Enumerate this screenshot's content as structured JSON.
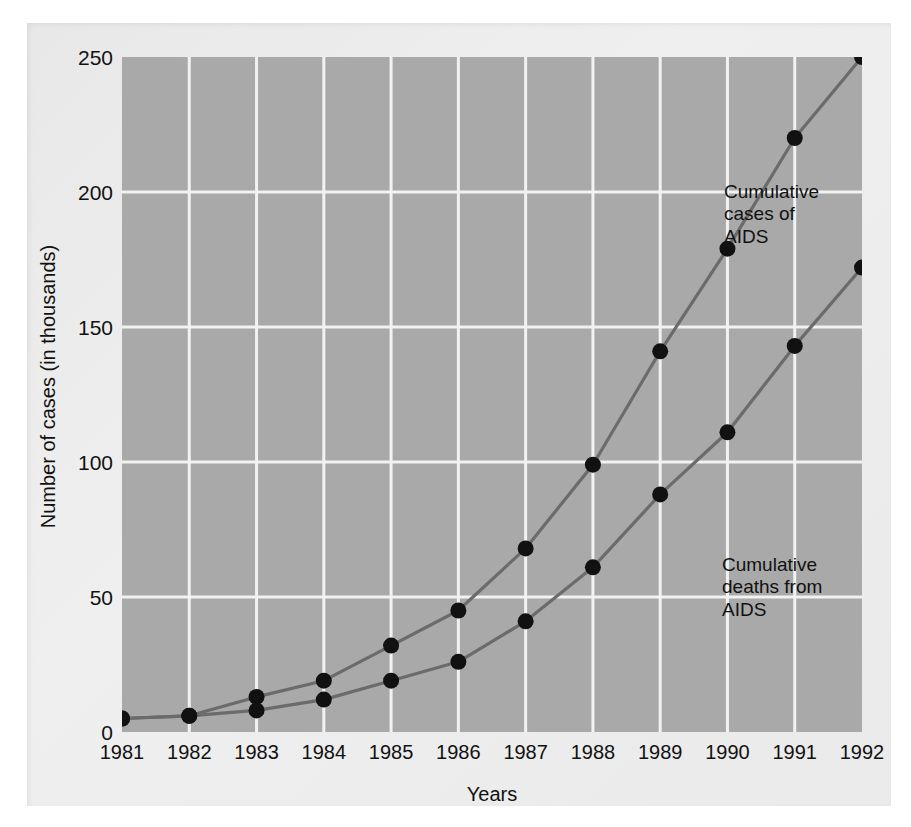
{
  "chart_data": {
    "type": "line",
    "title": "",
    "xlabel": "Years",
    "ylabel": "Number of cases (in thousands)",
    "categories": [
      "1981",
      "1982",
      "1983",
      "1984",
      "1985",
      "1986",
      "1987",
      "1988",
      "1989",
      "1990",
      "1991",
      "1992"
    ],
    "x": [
      1981,
      1982,
      1983,
      1984,
      1985,
      1986,
      1987,
      1988,
      1989,
      1990,
      1991,
      1992
    ],
    "xlim": [
      1981,
      1992
    ],
    "ylim": [
      0,
      250
    ],
    "yticks": [
      0,
      50,
      100,
      150,
      200,
      250
    ],
    "ytick_labels": [
      "0",
      "50",
      "100",
      "150",
      "200",
      "250"
    ],
    "grid": true,
    "legend": "annotations-inline",
    "series": [
      {
        "name": "Cumulative cases of AIDS",
        "values": [
          5,
          6,
          13,
          19,
          32,
          45,
          68,
          99,
          141,
          179,
          220,
          250
        ]
      },
      {
        "name": "Cumulative deaths from AIDS",
        "values": [
          5,
          6,
          8,
          12,
          19,
          26,
          41,
          61,
          88,
          111,
          143,
          172
        ]
      }
    ],
    "annotations": [
      {
        "id": "cases",
        "text": "Cumulative\ncases of\nAIDS"
      },
      {
        "id": "deaths",
        "text": "Cumulative\ndeaths from\nAIDS"
      }
    ]
  },
  "style": {
    "plot_background": "#a9a9a9",
    "panel_background": "#ececec",
    "grid_color": "#f2f2f2",
    "line_color": "#6b6b6b",
    "marker_color": "#111111",
    "text_color": "#111111"
  }
}
